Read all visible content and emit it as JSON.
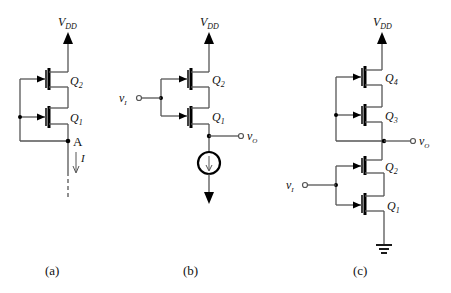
{
  "figure": {
    "panels": [
      {
        "id": "a",
        "caption": "(a)",
        "supply_label": "V",
        "supply_sub": "DD",
        "transistors": [
          {
            "name": "Q",
            "sub": "2"
          },
          {
            "name": "Q",
            "sub": "1"
          }
        ],
        "node_label": "A",
        "current_label": "I"
      },
      {
        "id": "b",
        "caption": "(b)",
        "supply_label": "V",
        "supply_sub": "DD",
        "input_label": "v",
        "input_sub": "I",
        "output_label": "v",
        "output_sub": "O",
        "transistors": [
          {
            "name": "Q",
            "sub": "2"
          },
          {
            "name": "Q",
            "sub": "1"
          }
        ]
      },
      {
        "id": "c",
        "caption": "(c)",
        "supply_label": "V",
        "supply_sub": "DD",
        "input_label": "v",
        "input_sub": "I",
        "output_label": "v",
        "output_sub": "O",
        "transistors": [
          {
            "name": "Q",
            "sub": "4"
          },
          {
            "name": "Q",
            "sub": "3"
          },
          {
            "name": "Q",
            "sub": "2"
          },
          {
            "name": "Q",
            "sub": "1"
          }
        ]
      }
    ]
  }
}
